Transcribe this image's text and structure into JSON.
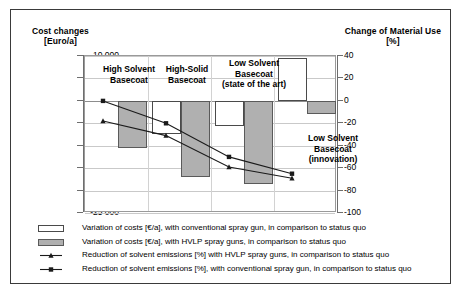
{
  "axis_titles": {
    "left_name": "Cost changes",
    "left_unit": "[Euro/a]",
    "right_name": "Change of Material Use",
    "right_unit": "[%]"
  },
  "categories": [
    {
      "label": "High Solvent\nBasecoat"
    },
    {
      "label": "High-Solid\nBasecoat"
    },
    {
      "label": "Low Solvent\nBasecoat\n(state of the art)"
    },
    {
      "label": "Low Solvent\nBasecoat\n(innovation)"
    }
  ],
  "y_left_ticks": [
    "10 000",
    "5 000",
    "0",
    "-5 000",
    "-10 000",
    "-15 000",
    "-20 000",
    "-25 000"
  ],
  "y_right_ticks": [
    "40",
    "20",
    "0",
    "-20",
    "-40",
    "-60",
    "-80",
    "-100"
  ],
  "legend": [
    {
      "marker": "bar-white-swatch",
      "text": "Variation of costs [€/a], with conventional spray gun, in comparison to status quo"
    },
    {
      "marker": "bar-gray-swatch",
      "text": "Variation of costs [€/a],  with HVLP spray guns, in comparison to status quo"
    },
    {
      "marker": "line-triangle-marker",
      "text": "Reduction of solvent emissions [%] with HVLP spray guns, in comparison to status quo"
    },
    {
      "marker": "line-square-marker",
      "text": "Reduction of solvent emissions  [%], with conventional spray gun, in comparison to status quo"
    }
  ],
  "colors": {
    "bar_white_fill": "#ffffff",
    "bar_white_edge": "#4a4a4a",
    "bar_gray_fill": "#b0b0b0",
    "bar_gray_edge": "#5a5a5a",
    "series_line": "#1a1a1a",
    "grid": "#c9c9c9",
    "frame": "#3a3a3a"
  },
  "chart_data": {
    "type": "bar",
    "title": "",
    "xlabel": "",
    "ylabel": "Cost changes [Euro/a]",
    "y2label": "Change of Material Use [%]",
    "ylim": [
      -25000,
      10000
    ],
    "y2lim": [
      -100,
      40
    ],
    "grid": true,
    "legend_position": "bottom",
    "categories": [
      "High Solvent Basecoat",
      "High-Solid Basecoat",
      "Low Solvent Basecoat (state of the art)",
      "Low Solvent Basecoat (innovation)"
    ],
    "series": [
      {
        "name": "Variation of costs [€/a], with conventional spray gun, in comparison to status quo",
        "type": "bar",
        "axis": "left",
        "unit": "Euro/a",
        "values": [
          0,
          -7500,
          -5500,
          9500
        ]
      },
      {
        "name": "Variation of costs [€/a], with HVLP spray guns, in comparison to status quo",
        "type": "bar",
        "axis": "left",
        "unit": "Euro/a",
        "values": [
          -10500,
          -17000,
          -18500,
          -3000
        ]
      },
      {
        "name": "Reduction of solvent emissions [%] with HVLP spray guns, in comparison to status quo",
        "type": "line",
        "axis": "right",
        "unit": "%",
        "marker": "triangle",
        "values": [
          -18,
          -31,
          -59,
          -69
        ]
      },
      {
        "name": "Reduction of solvent emissions [%], with conventional spray gun, in comparison to status quo",
        "type": "line",
        "axis": "right",
        "unit": "%",
        "marker": "square",
        "values": [
          0,
          -20,
          -50,
          -65
        ]
      }
    ]
  }
}
